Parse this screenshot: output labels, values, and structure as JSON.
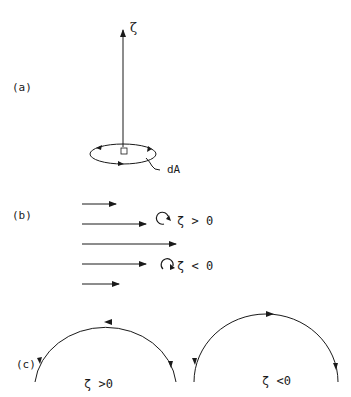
{
  "panels": {
    "a": {
      "label": "(a)",
      "vector_symbol": "ζ",
      "area_label": "dA"
    },
    "b": {
      "label": "(b)",
      "positive_relation": "ζ > 0",
      "negative_relation": "ζ < 0",
      "flow_arrows": [
        {
          "y": 204,
          "x_start": 82,
          "x_end": 116
        },
        {
          "y": 224,
          "x_start": 82,
          "x_end": 146
        },
        {
          "y": 244,
          "x_start": 82,
          "x_end": 176
        },
        {
          "y": 264,
          "x_start": 82,
          "x_end": 146
        },
        {
          "y": 284,
          "x_start": 82,
          "x_end": 119
        }
      ]
    },
    "c": {
      "label": "(c)",
      "left_arc_relation": "ζ >0",
      "right_arc_relation": "ζ <0"
    }
  },
  "colors": {
    "ink": "#1a1a1a",
    "background": "#ffffff"
  }
}
